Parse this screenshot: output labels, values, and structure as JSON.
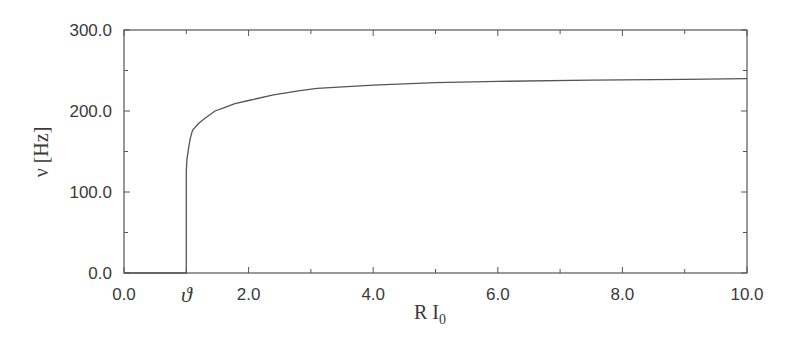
{
  "chart_data": {
    "type": "line",
    "title": "",
    "xlabel": "R I0",
    "xlabel_main": "R I",
    "xlabel_sub": "0",
    "ylabel": "ν [Hz]",
    "xlim": [
      0.0,
      10.0
    ],
    "ylim": [
      0.0,
      300.0
    ],
    "grid": false,
    "legend": null,
    "x_ticks": [
      0.0,
      2.0,
      4.0,
      6.0,
      8.0,
      10.0
    ],
    "x_tick_labels": [
      "0.0",
      "2.0",
      "4.0",
      "6.0",
      "8.0",
      "10.0"
    ],
    "y_ticks": [
      0.0,
      100.0,
      200.0,
      300.0
    ],
    "y_tick_labels": [
      "0.0",
      "100.0",
      "200.0",
      "300.0"
    ],
    "annotations": [
      {
        "text": "ϑ",
        "x": 1.0,
        "position": "below x-axis",
        "meaning": "threshold"
      }
    ],
    "series": [
      {
        "name": "firing rate",
        "x": [
          0.0,
          1.0,
          1.0,
          1.01,
          1.03,
          1.06,
          1.1,
          1.2,
          1.3,
          1.46,
          1.6,
          1.78,
          2.0,
          2.4,
          2.8,
          3.1,
          4.0,
          5.0,
          6.0,
          7.5,
          9.0,
          10.0
        ],
        "y": [
          0.0,
          0.0,
          125.0,
          140.0,
          151.0,
          165.0,
          176.0,
          185.0,
          191.0,
          200.0,
          204.0,
          209.0,
          213.0,
          220.0,
          225.0,
          228.0,
          232.0,
          235.0,
          236.5,
          238.0,
          239.0,
          240.0
        ]
      }
    ]
  }
}
